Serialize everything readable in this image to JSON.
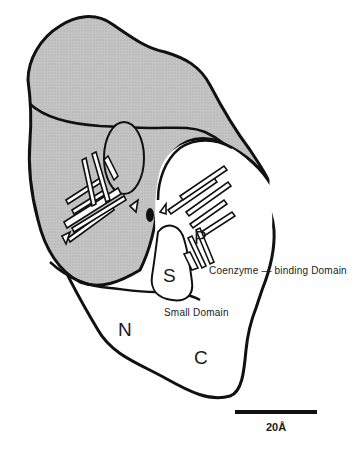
{
  "figure": {
    "type": "protein domain schematic",
    "colors": {
      "shaded_domain": "#bdbdbd",
      "outline": "#111111",
      "background": "#ffffff"
    },
    "labels": {
      "p_site": "P",
      "s_site": "S",
      "n_terminus": "N",
      "c_terminus": "C",
      "coenzyme_domain": "Coenzyme  — binding  Domain",
      "small_domain": "Small  Domain"
    },
    "scale_bar": {
      "label": "20Å",
      "length_px": 82
    }
  }
}
